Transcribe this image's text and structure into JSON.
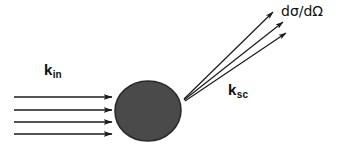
{
  "figure": {
    "background_color": "#ffffff",
    "line_color": "#1a1a1a",
    "scatterer": {
      "name": "scattering-target",
      "fill_color": "#4a4a4a",
      "stroke_color": "#2b2b2b",
      "center_x": 148,
      "center_y": 111,
      "radius_x": 33,
      "radius_y": 30
    },
    "incident_beam": {
      "label_text": "k",
      "label_subscript": "in",
      "arrow_count": 4,
      "x_start": 14,
      "x_end": 112,
      "y_positions": [
        97,
        110,
        122,
        134
      ]
    },
    "scattered_beam": {
      "label_text": "k",
      "label_subscript": "sc",
      "ray_count": 3,
      "origin_x": 184,
      "origin_y": 99,
      "endpoints": [
        [
          273,
          12
        ],
        [
          283,
          22
        ],
        [
          286,
          33
        ]
      ]
    },
    "cross_section_label": "dσ/dΩ"
  }
}
